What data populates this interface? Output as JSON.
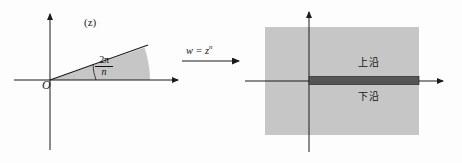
{
  "figure": {
    "width": 462,
    "height": 163,
    "background_color": "#fdfdfd",
    "shade_color": "#c8c8c8",
    "slit_color": "#4a4a4a",
    "axis_color": "#1a1a1a"
  },
  "panel_z": {
    "plane_label": "(z)",
    "origin_label": "O",
    "angle": {
      "numerator": "2π",
      "denominator": "n",
      "text": "2π/n"
    }
  },
  "mapping": {
    "equation_lhs": "w",
    "equation_eq": "=",
    "equation_base": "z",
    "equation_exponent": "n",
    "equation_text": "w = zⁿ",
    "arrow": "arrow-right-icon"
  },
  "panel_w": {
    "plane_label": "(w)",
    "origin_label": "O",
    "upper_edge_label": "上沿",
    "lower_edge_label": "下沿"
  }
}
